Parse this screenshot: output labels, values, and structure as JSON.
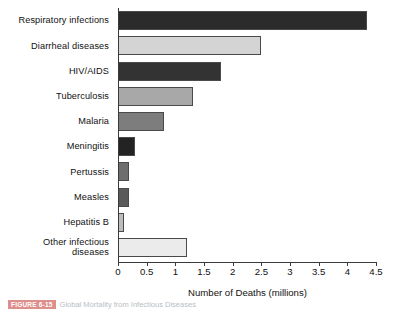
{
  "chart_data": {
    "type": "bar",
    "orientation": "horizontal",
    "title": "",
    "xlabel": "Number of Deaths (millions)",
    "ylabel": "",
    "xlim": [
      0,
      4.5
    ],
    "xticks": [
      "0",
      "0.5",
      "1",
      "1.5",
      "2",
      "2.5",
      "3",
      "3.5",
      "4",
      "4.5"
    ],
    "xtick_values": [
      0,
      0.5,
      1,
      1.5,
      2,
      2.5,
      3,
      3.5,
      4,
      4.5
    ],
    "grid": false,
    "legend": null,
    "categories": [
      "Respiratory infections",
      "Diarrheal diseases",
      "HIV/AIDS",
      "Tuberculosis",
      "Malaria",
      "Meningitis",
      "Pertussis",
      "Measles",
      "Hepatitis B",
      "Other infectious\ndiseases"
    ],
    "values": [
      4.35,
      2.5,
      1.8,
      1.3,
      0.8,
      0.3,
      0.2,
      0.2,
      0.1,
      1.2
    ],
    "bar_colors": [
      "#2b2b2b",
      "#d4d4d4",
      "#333333",
      "#a8a8a8",
      "#7d7d7d",
      "#232323",
      "#6e6e6e",
      "#5a5a5a",
      "#bdbdbd",
      "#ebebeb"
    ],
    "bar_edge_color": "#4a4a4a"
  },
  "axis": {
    "x_title": "Number of Deaths (millions)",
    "ticks": [
      "0",
      "0.5",
      "1",
      "1.5",
      "2",
      "2.5",
      "3",
      "3.5",
      "4",
      "4.5"
    ]
  },
  "caption": {
    "figure_tag": "FIGURE 6-15",
    "text": "Global Mortality from Infectious Diseases"
  }
}
